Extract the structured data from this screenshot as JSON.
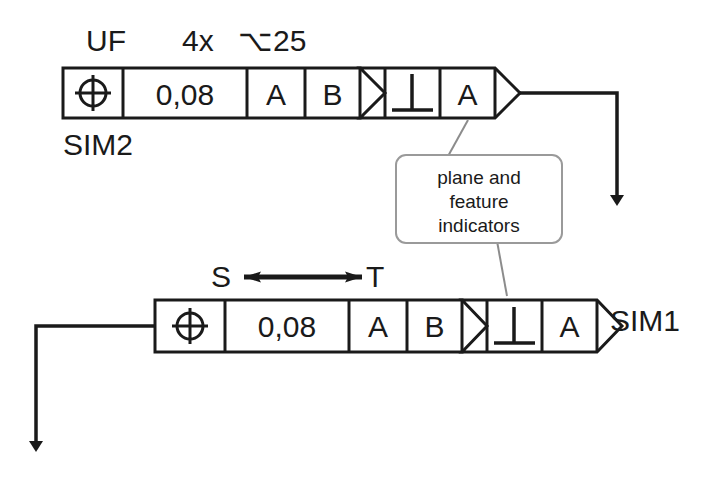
{
  "diagram": {
    "ink_color": "#1a1a1a",
    "leader_color": "#8c8c8c",
    "background": "#ffffff"
  },
  "annotations": {
    "upper_feature_label": "UF",
    "quantity": "4x",
    "diameter": "⌥25",
    "sim2_label": "SIM2",
    "sim1_label": "SIM1",
    "between_start": "S",
    "between_end": "T"
  },
  "frames": [
    {
      "id": "top-frame",
      "name": "SIM2 position frame",
      "symbol": "position-symbol",
      "tolerance": "0,08",
      "datums": [
        "A",
        "B"
      ],
      "indicator": {
        "symbol": "perpendicularity-symbol",
        "datum": "A"
      }
    },
    {
      "id": "bottom-frame",
      "name": "SIM1 position frame",
      "symbol": "position-symbol",
      "tolerance": "0,08",
      "datums": [
        "A",
        "B"
      ],
      "indicator": {
        "symbol": "perpendicularity-symbol",
        "datum": "A"
      }
    }
  ],
  "callout": {
    "lines": [
      "plane and",
      "feature",
      "indicators"
    ]
  }
}
